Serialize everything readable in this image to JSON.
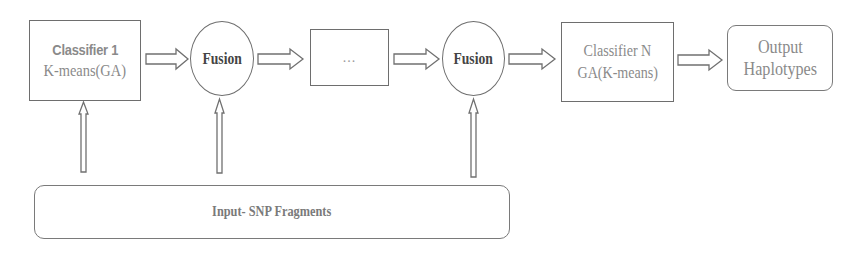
{
  "diagram": {
    "nodes": {
      "classifier_1": {
        "title": "Classifier 1",
        "subtitle": "K-means(GA)"
      },
      "fusion_1": {
        "label": "Fusion"
      },
      "ellipsis": {
        "label": "..."
      },
      "fusion_2": {
        "label": "Fusion"
      },
      "classifier_n": {
        "title": "Classifier N",
        "subtitle": "GA(K-means)"
      },
      "output": {
        "line1": "Output",
        "line2": "Haplotypes"
      },
      "input": {
        "label": "Input- SNP Fragments"
      }
    },
    "edges": [
      {
        "from": "classifier_1",
        "to": "fusion_1",
        "style": "block-arrow"
      },
      {
        "from": "fusion_1",
        "to": "ellipsis",
        "style": "block-arrow"
      },
      {
        "from": "ellipsis",
        "to": "fusion_2",
        "style": "block-arrow"
      },
      {
        "from": "fusion_2",
        "to": "classifier_n",
        "style": "block-arrow"
      },
      {
        "from": "classifier_n",
        "to": "output",
        "style": "block-arrow"
      },
      {
        "from": "input",
        "to": "classifier_1",
        "style": "thin-block-arrow"
      },
      {
        "from": "input",
        "to": "fusion_1",
        "style": "thin-block-arrow"
      },
      {
        "from": "input",
        "to": "fusion_2",
        "style": "thin-block-arrow"
      }
    ],
    "colors": {
      "stroke": "#6e6e6e",
      "text_gray": "#8a8a8a",
      "text_dark": "#444444",
      "background": "#ffffff"
    }
  }
}
